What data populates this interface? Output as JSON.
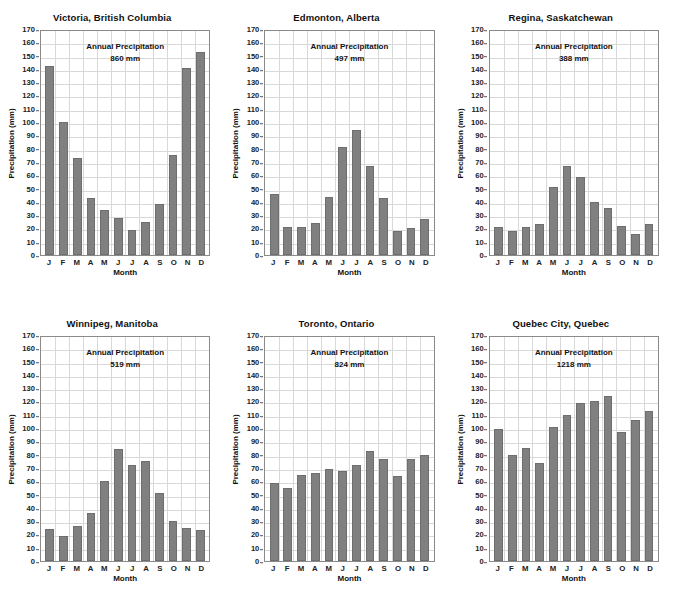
{
  "figure": {
    "axis_label_y": "Precipitation (mm)",
    "axis_label_x": "Month",
    "annotation_title": "Annual Precipitation",
    "unit": "mm",
    "bar_color": "#808080",
    "grid_color": "#d8d8d8",
    "axis_color": "#8a8a8a",
    "background": "#ffffff"
  },
  "chart_data": [
    {
      "type": "bar",
      "title": "Victoria, British Columbia",
      "xlabel": "Month",
      "ylabel": "Precipitation (mm)",
      "ylim": [
        0,
        170
      ],
      "ytick_step": 10,
      "grid": true,
      "legend": "none",
      "annual_total": "860 mm",
      "annual_label": "Annual Precipitation",
      "categories": [
        "J",
        "F",
        "M",
        "A",
        "M",
        "J",
        "J",
        "A",
        "S",
        "O",
        "N",
        "D"
      ],
      "yticks": [
        0,
        10,
        20,
        30,
        40,
        50,
        60,
        70,
        80,
        90,
        100,
        110,
        120,
        130,
        140,
        150,
        160,
        170
      ],
      "values": [
        142,
        100,
        73,
        43,
        34,
        28,
        19,
        25,
        38,
        75,
        141,
        153
      ]
    },
    {
      "type": "bar",
      "title": "Edmonton, Alberta",
      "xlabel": "Month",
      "ylabel": "Precipitation (mm)",
      "ylim": [
        0,
        170
      ],
      "ytick_step": 10,
      "grid": true,
      "legend": "none",
      "annual_total": "497 mm",
      "annual_label": "Annual Precipitation",
      "categories": [
        "J",
        "F",
        "M",
        "A",
        "M",
        "J",
        "J",
        "A",
        "S",
        "O",
        "N",
        "D"
      ],
      "yticks": [
        0,
        10,
        20,
        30,
        40,
        50,
        60,
        70,
        80,
        90,
        100,
        110,
        120,
        130,
        140,
        150,
        160,
        170
      ],
      "values": [
        46,
        21,
        21,
        24,
        44,
        81,
        94,
        67,
        43,
        18,
        20,
        27
      ]
    },
    {
      "type": "bar",
      "title": "Regina, Saskatchewan",
      "xlabel": "Month",
      "ylabel": "Precipitation (mm)",
      "ylim": [
        0,
        170
      ],
      "ytick_step": 10,
      "grid": true,
      "legend": "none",
      "annual_total": "388 mm",
      "annual_label": "Annual Precipitation",
      "categories": [
        "J",
        "F",
        "M",
        "A",
        "M",
        "J",
        "J",
        "A",
        "S",
        "O",
        "N",
        "D"
      ],
      "yticks": [
        0,
        10,
        20,
        30,
        40,
        50,
        60,
        70,
        80,
        90,
        100,
        110,
        120,
        130,
        140,
        150,
        160,
        170
      ],
      "values": [
        21,
        18,
        21,
        23,
        51,
        67,
        59,
        40,
        35,
        22,
        16,
        23
      ]
    },
    {
      "type": "bar",
      "title": "Winnipeg, Manitoba",
      "xlabel": "Month",
      "ylabel": "Precipitation (mm)",
      "ylim": [
        0,
        170
      ],
      "ytick_step": 10,
      "grid": true,
      "legend": "none",
      "annual_total": "519 mm",
      "annual_label": "Annual Precipitation",
      "categories": [
        "J",
        "F",
        "M",
        "A",
        "M",
        "J",
        "J",
        "A",
        "S",
        "O",
        "N",
        "D"
      ],
      "yticks": [
        0,
        10,
        20,
        30,
        40,
        50,
        60,
        70,
        80,
        90,
        100,
        110,
        120,
        130,
        140,
        150,
        160,
        170
      ],
      "values": [
        24,
        19,
        26,
        36,
        60,
        84,
        72,
        75,
        51,
        30,
        25,
        23
      ]
    },
    {
      "type": "bar",
      "title": "Toronto, Ontario",
      "xlabel": "Month",
      "ylabel": "Precipitation (mm)",
      "ylim": [
        0,
        170
      ],
      "ytick_step": 10,
      "grid": true,
      "legend": "none",
      "annual_total": "824 mm",
      "annual_label": "Annual Precipitation",
      "categories": [
        "J",
        "F",
        "M",
        "A",
        "M",
        "J",
        "J",
        "A",
        "S",
        "O",
        "N",
        "D"
      ],
      "yticks": [
        0,
        10,
        20,
        30,
        40,
        50,
        60,
        70,
        80,
        90,
        100,
        110,
        120,
        130,
        140,
        150,
        160,
        170
      ],
      "values": [
        59,
        55,
        65,
        66,
        69,
        68,
        72,
        83,
        77,
        64,
        77,
        80
      ]
    },
    {
      "type": "bar",
      "title": "Quebec City, Quebec",
      "xlabel": "Month",
      "ylabel": "Precipitation (mm)",
      "ylim": [
        0,
        170
      ],
      "ytick_step": 10,
      "grid": true,
      "legend": "none",
      "annual_total": "1218 mm",
      "annual_label": "Annual Precipitation",
      "categories": [
        "J",
        "F",
        "M",
        "A",
        "M",
        "J",
        "J",
        "A",
        "S",
        "O",
        "N",
        "D"
      ],
      "yticks": [
        0,
        10,
        20,
        30,
        40,
        50,
        60,
        70,
        80,
        90,
        100,
        110,
        120,
        130,
        140,
        150,
        160,
        170
      ],
      "values": [
        99,
        80,
        85,
        74,
        101,
        110,
        119,
        120,
        124,
        97,
        106,
        113
      ]
    }
  ]
}
